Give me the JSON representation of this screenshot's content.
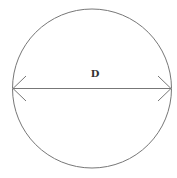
{
  "diagram": {
    "type": "circle-diameter",
    "label": "D",
    "colors": {
      "stroke": "#777777",
      "text": "#333333",
      "background": "#ffffff"
    },
    "circle": {
      "cx": 92,
      "cy": 88.5,
      "r": 79.5
    },
    "diameter": {
      "x1": 13,
      "x2": 171,
      "y": 88.5,
      "arrowheads": "both"
    }
  }
}
